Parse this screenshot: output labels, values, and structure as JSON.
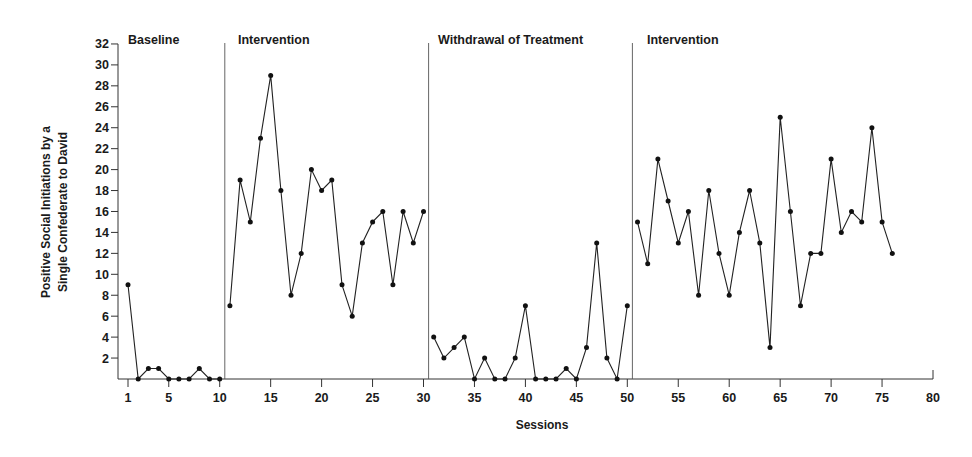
{
  "chart_data": {
    "type": "line",
    "title": "",
    "xlabel": "Sessions",
    "ylabel": "Positive Social Initiations by a Single Confederate to David",
    "ylabel_lines": [
      "Positive Social Initiations by a",
      "Single Confederate to David"
    ],
    "xlim": [
      0,
      80
    ],
    "ylim": [
      0,
      32
    ],
    "xticks": [
      1,
      5,
      10,
      15,
      20,
      25,
      30,
      35,
      40,
      45,
      50,
      55,
      60,
      65,
      70,
      75,
      80
    ],
    "yticks": [
      2,
      4,
      6,
      8,
      10,
      12,
      14,
      16,
      18,
      20,
      22,
      24,
      26,
      28,
      30,
      32
    ],
    "grid": false,
    "legend": null,
    "phase_dividers": [
      10.5,
      30.5,
      50.5
    ],
    "phases": [
      {
        "label": "Baseline",
        "start": 1,
        "end": 10,
        "x": [
          1,
          2,
          3,
          4,
          5,
          6,
          7,
          8,
          9,
          10
        ],
        "values": [
          9,
          0,
          1,
          1,
          0,
          0,
          0,
          1,
          0,
          0
        ]
      },
      {
        "label": "Intervention",
        "start": 11,
        "end": 30,
        "x": [
          11,
          12,
          13,
          14,
          15,
          16,
          17,
          18,
          19,
          20,
          21,
          22,
          23,
          24,
          25,
          26,
          27,
          28,
          29,
          30
        ],
        "values": [
          7,
          19,
          15,
          23,
          29,
          18,
          8,
          12,
          20,
          18,
          19,
          9,
          6,
          13,
          15,
          16,
          9,
          16,
          13,
          16
        ]
      },
      {
        "label": "Withdrawal of Treatment",
        "start": 31,
        "end": 50,
        "x": [
          31,
          32,
          33,
          34,
          35,
          36,
          37,
          38,
          39,
          40,
          41,
          42,
          43,
          44,
          45,
          46,
          47,
          48,
          49,
          50
        ],
        "values": [
          4,
          2,
          3,
          4,
          0,
          2,
          0,
          0,
          2,
          7,
          0,
          0,
          0,
          1,
          0,
          3,
          13,
          2,
          0,
          7
        ]
      },
      {
        "label": "Intervention",
        "start": 51,
        "end": 76,
        "x": [
          51,
          52,
          53,
          54,
          55,
          56,
          57,
          58,
          59,
          60,
          61,
          62,
          63,
          64,
          65,
          66,
          67,
          68,
          69,
          70,
          71,
          72,
          73,
          74,
          75,
          76
        ],
        "values": [
          15,
          11,
          21,
          17,
          13,
          16,
          8,
          18,
          12,
          8,
          14,
          18,
          13,
          3,
          25,
          16,
          7,
          12,
          12,
          21,
          14,
          16,
          15,
          24,
          15,
          12
        ]
      }
    ]
  },
  "layout": {
    "x_origin_px": 118,
    "x_session1_px": 128,
    "px_per_session": 10.19,
    "y_zero_px": 379,
    "px_per_unit": 10.47,
    "axis_end_px": 933,
    "divider_top_px": 43
  }
}
